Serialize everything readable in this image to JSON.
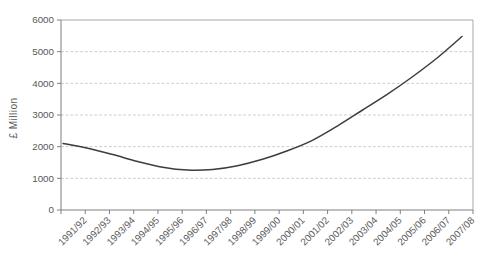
{
  "chart_data": {
    "type": "line",
    "ylabel": "£ Million",
    "xlabel": "",
    "categories": [
      "1991/92",
      "1992/93",
      "1993/94",
      "1994/95",
      "1995/96",
      "1996/97",
      "1997/98",
      "1998/99",
      "1999/00",
      "2000/01",
      "2001/02",
      "2002/03",
      "2003/04",
      "2004/05",
      "2005/06",
      "2006/07",
      "2007/08"
    ],
    "values": [
      2100,
      1950,
      1750,
      1530,
      1350,
      1260,
      1280,
      1400,
      1600,
      1870,
      2200,
      2650,
      3150,
      3650,
      4200,
      4800,
      5480
    ],
    "yticks": [
      0,
      1000,
      2000,
      3000,
      4000,
      5000,
      6000
    ],
    "ylim": [
      0,
      6000
    ],
    "grid": "horizontal-dashed",
    "legend_position": "none"
  },
  "style": {
    "line_color": "#3d3d3d",
    "axis_color": "#7f7f7f",
    "border_color": "#a8a8a8",
    "grid_color": "#c9c9c9",
    "text_color": "#595959",
    "background": "#ffffff"
  }
}
